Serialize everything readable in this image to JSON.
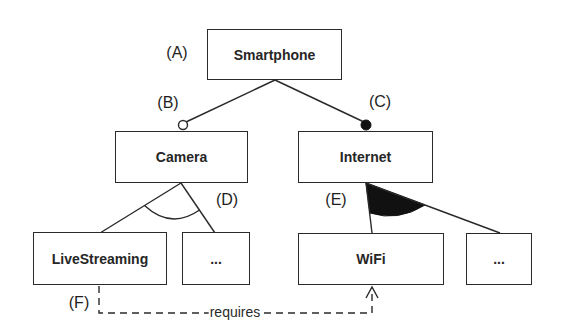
{
  "diagram": {
    "type": "feature-model",
    "nodes": {
      "root": {
        "label": "Smartphone",
        "marker": "(A)"
      },
      "camera": {
        "label": "Camera",
        "marker": "(B)",
        "relation": "optional"
      },
      "internet": {
        "label": "Internet",
        "marker": "(C)",
        "relation": "mandatory"
      },
      "livestreaming": {
        "label": "LiveStreaming"
      },
      "camera_more": {
        "label": "..."
      },
      "wifi": {
        "label": "WiFi"
      },
      "internet_more": {
        "label": "..."
      }
    },
    "groups": {
      "camera_group": {
        "marker": "(D)",
        "kind": "alternative (xor)"
      },
      "internet_group": {
        "marker": "(E)",
        "kind": "or"
      }
    },
    "constraints": [
      {
        "marker": "(F)",
        "from": "LiveStreaming",
        "to": "WiFi",
        "label": "requires"
      }
    ],
    "colors": {
      "stroke": "#2a2a2a",
      "fill": "#111111",
      "background": "#ffffff"
    }
  }
}
